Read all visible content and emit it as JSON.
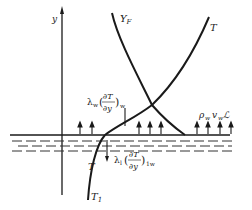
{
  "diagram": {
    "axis_label": "y",
    "curves": {
      "fuel_fraction": {
        "label_main": "Y",
        "label_sub": "F"
      },
      "temperature_gas": {
        "label": "T"
      },
      "temperature_liquid": {
        "label": "T"
      },
      "temperature_interior": {
        "label_main": "T",
        "label_sub": "1"
      }
    },
    "annotations": {
      "gas_heat_flux": {
        "prefix_main": "λ",
        "prefix_sub": "w",
        "numerator": "∂T",
        "denominator": "∂y",
        "suffix_sub": "w"
      },
      "liquid_heat_flux": {
        "prefix_main": "λ",
        "prefix_sub": "l",
        "numerator": "∂T",
        "denominator": "∂y",
        "suffix_sub": "1w"
      },
      "mass_flux": {
        "rho": "ρ",
        "rho_sub": "w",
        "v": "v",
        "v_sub": "w",
        "L": "ℒ"
      }
    },
    "colors": {
      "ink": "#1a1a1a",
      "background": "#ffffff"
    }
  }
}
